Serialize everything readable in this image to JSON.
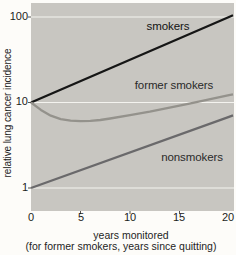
{
  "figure": {
    "y_axis_title": "relative lung cancer incidence",
    "x_axis_title": "years monitored",
    "x_axis_subtitle": "(for former smokers, years since quitting)",
    "y_ticks": [
      "100",
      "10",
      "1"
    ],
    "x_ticks": [
      "0",
      "5",
      "10",
      "15",
      "20"
    ],
    "colors": {
      "plot_background": "#c8c6c1",
      "gridline": "#f4f3ef",
      "page_background": "#fdfcf9"
    }
  },
  "chart_data": {
    "type": "line",
    "title": "",
    "xlabel": "years monitored (for former smokers, years since quitting)",
    "ylabel": "relative lung cancer incidence",
    "x_scale": "linear",
    "y_scale": "log",
    "xlim": [
      0,
      20
    ],
    "ylim": [
      1,
      100
    ],
    "x_tick_values": [
      0,
      5,
      10,
      15,
      20
    ],
    "y_gridline_values": [
      1,
      10,
      100
    ],
    "legend_position": "inline-labels",
    "grid": "horizontal-only",
    "series": [
      {
        "name": "smokers",
        "color": "#161616",
        "points": [
          [
            0,
            10
          ],
          [
            20,
            100
          ]
        ]
      },
      {
        "name": "former smokers",
        "color": "#94928c",
        "points": [
          [
            0,
            10
          ],
          [
            1,
            8.2
          ],
          [
            2,
            7.0
          ],
          [
            3,
            6.4
          ],
          [
            4,
            6.15
          ],
          [
            5,
            6.05
          ],
          [
            6,
            6.1
          ],
          [
            7,
            6.25
          ],
          [
            8,
            6.5
          ],
          [
            10,
            7.1
          ],
          [
            12,
            7.8
          ],
          [
            14,
            8.7
          ],
          [
            16,
            9.7
          ],
          [
            18,
            10.9
          ],
          [
            20,
            12.2
          ]
        ]
      },
      {
        "name": "nonsmokers",
        "color": "#6a696b",
        "points": [
          [
            0,
            1
          ],
          [
            20,
            6.8
          ]
        ]
      }
    ]
  }
}
